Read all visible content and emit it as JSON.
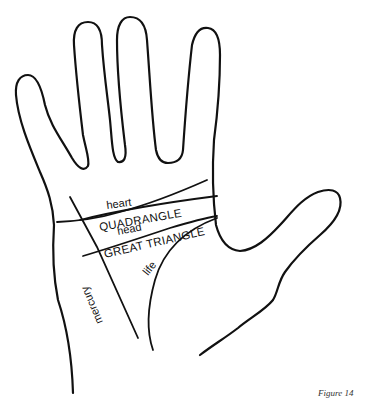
{
  "figure": {
    "caption": "Figure 14"
  },
  "labels": {
    "heart": "heart",
    "quadrangle": "QUADRANGLE",
    "head": "head",
    "great_triangle": "GREAT TRIANGLE",
    "life": "life",
    "mercury": "mercury"
  },
  "colors": {
    "stroke": "#111111",
    "background": "#ffffff"
  }
}
